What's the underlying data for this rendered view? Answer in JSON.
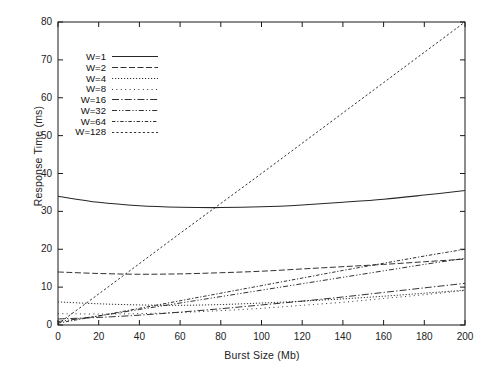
{
  "chart_data": {
    "type": "line",
    "title": "",
    "xlabel": "Burst Size (Mb)",
    "ylabel": "Response Time (ms)",
    "xlim": [
      0,
      200
    ],
    "ylim": [
      0,
      80
    ],
    "xticks": [
      0,
      20,
      40,
      60,
      80,
      100,
      120,
      140,
      160,
      180,
      200
    ],
    "yticks": [
      0,
      10,
      20,
      30,
      40,
      50,
      60,
      70,
      80
    ],
    "grid": false,
    "legend_position": "upper-left-inside",
    "x": [
      0,
      20,
      40,
      60,
      80,
      100,
      120,
      140,
      160,
      180,
      200
    ],
    "series": [
      {
        "name": "W=1",
        "dash": "none",
        "values": [
          34.0,
          32.4,
          31.5,
          31.1,
          31.0,
          31.2,
          31.7,
          32.4,
          33.2,
          34.3,
          35.5
        ]
      },
      {
        "name": "W=2",
        "dash": "dashed-long",
        "values": [
          14.0,
          13.6,
          13.4,
          13.5,
          13.8,
          14.2,
          14.8,
          15.4,
          16.0,
          16.7,
          17.4
        ]
      },
      {
        "name": "W=4",
        "dash": "dotted-fine",
        "values": [
          6.1,
          5.6,
          5.3,
          5.2,
          5.4,
          5.8,
          6.3,
          6.9,
          7.6,
          8.4,
          9.2
        ]
      },
      {
        "name": "W=8",
        "dash": "dotted-sparse",
        "values": [
          3.0,
          2.9,
          3.0,
          3.3,
          3.8,
          4.4,
          5.2,
          6.0,
          7.0,
          8.0,
          9.1
        ]
      },
      {
        "name": "W=16",
        "dash": "dash-dot",
        "values": [
          1.6,
          2.0,
          2.6,
          3.4,
          4.3,
          5.3,
          6.3,
          7.4,
          8.6,
          9.8,
          11.0
        ]
      },
      {
        "name": "W=32",
        "dash": "dash-dot-long",
        "values": [
          0.9,
          2.4,
          4.1,
          5.8,
          7.5,
          9.2,
          10.9,
          12.6,
          14.3,
          16.0,
          17.6
        ]
      },
      {
        "name": "W=64",
        "dash": "dash-dot-dot",
        "values": [
          0.5,
          2.4,
          4.4,
          6.4,
          8.4,
          10.4,
          12.4,
          14.4,
          16.3,
          18.2,
          20.0
        ]
      },
      {
        "name": "W=128",
        "dash": "dotted-medium",
        "values": [
          0.3,
          8.2,
          16.2,
          24.2,
          32.1,
          40.0,
          48.0,
          56.0,
          64.0,
          72.0,
          80.0
        ]
      }
    ]
  },
  "axes": {
    "ylabel_text": "Response Time (ms)",
    "xlabel_text": "Burst Size (Mb)",
    "ytick_labels": [
      "0",
      "10",
      "20",
      "30",
      "40",
      "50",
      "60",
      "70",
      "80"
    ],
    "xtick_labels": [
      "0",
      "20",
      "40",
      "60",
      "80",
      "100",
      "120",
      "140",
      "160",
      "180",
      "200"
    ]
  },
  "legend": {
    "entries": [
      {
        "label": "W=1"
      },
      {
        "label": "W=2"
      },
      {
        "label": "W=4"
      },
      {
        "label": "W=8"
      },
      {
        "label": "W=16"
      },
      {
        "label": "W=32"
      },
      {
        "label": "W=64"
      },
      {
        "label": "W=128"
      }
    ]
  },
  "style": {
    "line_color": "#262626",
    "axis_color": "#1a1a1a",
    "background": "#ffffff"
  }
}
